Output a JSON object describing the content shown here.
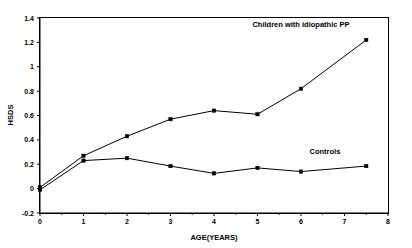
{
  "chart_data": {
    "type": "line",
    "title": "",
    "xlabel": "AGE(YEARS)",
    "ylabel": "HSDS",
    "xlim": [
      0,
      8
    ],
    "ylim": [
      -0.2,
      1.4
    ],
    "xticks": [
      "0",
      "1",
      "2",
      "3",
      "4",
      "5",
      "6",
      "7",
      "8"
    ],
    "xtick_values": [
      0,
      1,
      2,
      3,
      4,
      5,
      6,
      7,
      8
    ],
    "yticks": [
      "-0.2",
      "0",
      "0.2",
      "0.4",
      "0.6",
      "0.8",
      "1",
      "1.2",
      "1.4"
    ],
    "ytick_values": [
      -0.2,
      0,
      0.2,
      0.4,
      0.6,
      0.8,
      1,
      1.2,
      1.4
    ],
    "grid": false,
    "legend_position": "inline-annotation",
    "x": [
      0,
      1,
      2,
      3,
      4,
      5,
      6,
      7.5
    ],
    "series": [
      {
        "name": "Children with idiopathic PP",
        "label_x": 6.0,
        "label_y": 1.33,
        "values": [
          0.01,
          0.27,
          0.43,
          0.57,
          0.64,
          0.61,
          0.82,
          1.22
        ]
      },
      {
        "name": "Controls",
        "label_x": 6.55,
        "label_y": 0.285,
        "values": [
          -0.01,
          0.23,
          0.25,
          0.185,
          0.125,
          0.17,
          0.14,
          0.185
        ]
      }
    ]
  },
  "figure": {
    "marker_shape": "square",
    "line_color": "#000000",
    "background": "#ffffff"
  }
}
